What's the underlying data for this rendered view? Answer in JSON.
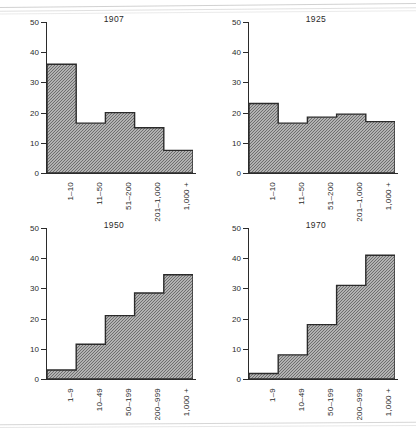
{
  "page": {
    "background": "#ffffff",
    "ink": "#2b2b2b"
  },
  "axis": {
    "y_ticks": [
      "0",
      "10",
      "20",
      "30",
      "40",
      "50"
    ],
    "y_min": 0,
    "y_max": 50
  },
  "chart_data": [
    {
      "type": "bar",
      "title": "1907",
      "categories": [
        "1–10",
        "11–50",
        "51–200",
        "201–1,000",
        "1,000 +"
      ],
      "values": [
        36,
        16.5,
        20,
        15,
        7.5
      ],
      "xlabel": "",
      "ylabel": "",
      "ylim": [
        0,
        50
      ],
      "grid": false,
      "legend": "none"
    },
    {
      "type": "bar",
      "title": "1925",
      "categories": [
        "1–10",
        "11–50",
        "51–200",
        "201–1,000",
        "1,000 +"
      ],
      "values": [
        23,
        16.5,
        18.5,
        19.5,
        17
      ],
      "xlabel": "",
      "ylabel": "",
      "ylim": [
        0,
        50
      ],
      "grid": false,
      "legend": "none"
    },
    {
      "type": "bar",
      "title": "1950",
      "categories": [
        "1–9",
        "10–49",
        "50–199",
        "200–999",
        "1,000 +"
      ],
      "values": [
        3,
        11.5,
        21,
        28.5,
        34.5
      ],
      "xlabel": "",
      "ylabel": "",
      "ylim": [
        0,
        50
      ],
      "grid": false,
      "legend": "none"
    },
    {
      "type": "bar",
      "title": "1970",
      "categories": [
        "1–9",
        "10–49",
        "50–199",
        "200–999",
        "1,000 +"
      ],
      "values": [
        1.8,
        8,
        18,
        31,
        41
      ],
      "xlabel": "",
      "ylabel": "",
      "ylim": [
        0,
        50
      ],
      "grid": false,
      "legend": "none"
    }
  ]
}
